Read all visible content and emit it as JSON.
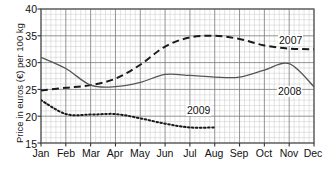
{
  "chart_data": {
    "type": "line",
    "title": "",
    "xlabel": "",
    "ylabel": "Price in euros (€) per 100 kg",
    "categories": [
      "Jan",
      "Feb",
      "Mar",
      "Apr",
      "May",
      "Jun",
      "Jul",
      "Aug",
      "Sep",
      "Oct",
      "Nov",
      "Dec"
    ],
    "xlim": [
      0,
      11
    ],
    "ylim": [
      15,
      40
    ],
    "yticks": [
      15,
      20,
      25,
      30,
      35,
      40
    ],
    "grid": true,
    "minor_grid": true,
    "legend_position": "inline-labels",
    "series": [
      {
        "name": "2007",
        "style": "dashed",
        "color": "#1a1a1a",
        "values": [
          24.8,
          25.3,
          25.8,
          27.0,
          29.6,
          33.0,
          34.7,
          35.0,
          34.4,
          33.2,
          32.6,
          32.5
        ],
        "label_x": 278,
        "label_y": 35
      },
      {
        "name": "2008",
        "style": "solid",
        "color": "#555555",
        "values": [
          31.0,
          28.9,
          25.8,
          25.5,
          26.3,
          27.8,
          27.6,
          27.3,
          27.3,
          28.6,
          29.8,
          25.5
        ],
        "label_x": 277,
        "label_y": 86
      },
      {
        "name": "2009",
        "style": "dotted",
        "color": "#1a1a1a",
        "values": [
          23.0,
          20.4,
          20.3,
          20.4,
          19.6,
          18.6,
          17.9,
          17.9,
          null,
          null,
          null,
          null
        ],
        "label_x": 186,
        "label_y": 105
      }
    ]
  },
  "axis": {
    "y_tick_labels": [
      "40",
      "35",
      "30",
      "25",
      "20",
      "15"
    ],
    "x_tick_labels": [
      "Jan",
      "Feb",
      "Mar",
      "Apr",
      "May",
      "Jun",
      "Jul",
      "Aug",
      "Sep",
      "Oct",
      "Nov",
      "Dec"
    ]
  }
}
